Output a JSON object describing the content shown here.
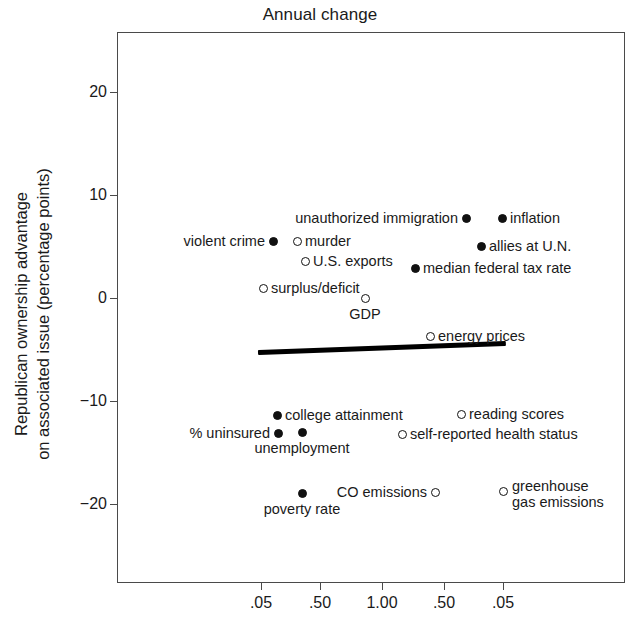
{
  "chart_data": {
    "type": "scatter",
    "title": "Annual change",
    "xlabel": "",
    "ylabel": "Republican ownership advantage\non associated issue (percentage points)",
    "ylabel_line1": "Republican ownership advantage",
    "ylabel_line2": "on associated issue (percentage points)",
    "ylim": [
      -26,
      25
    ],
    "yticks": [
      "20",
      "10",
      "0",
      "−10",
      "−20"
    ],
    "ytick_values": [
      20,
      10,
      0,
      -10,
      -20
    ],
    "xticks": [
      ".05",
      ".50",
      "1.00",
      ".50",
      ".05"
    ],
    "xtick_px": [
      261,
      320,
      382,
      444,
      503
    ],
    "grid": false,
    "legend": "none",
    "marker_styles": {
      "filled": "Republican-owned issue (solid circle)",
      "open": "Democratic-owned issue (open circle)"
    },
    "trendline": {
      "x_start_px": 258,
      "y_start_px": 352,
      "x_end_px": 506,
      "y_end_px": 343,
      "y_start_value": -4.3,
      "y_end_value": -3.5
    },
    "points": [
      {
        "label": "unauthorized immigration",
        "x_px": 466,
        "y_px": 218,
        "y_value": 8.3,
        "marker": "filled",
        "label_side": "left"
      },
      {
        "label": "inflation",
        "x_px": 502,
        "y_px": 218,
        "y_value": 8.3,
        "marker": "filled",
        "label_side": "right"
      },
      {
        "label": "violent crime",
        "x_px": 273,
        "y_px": 241,
        "y_value": 6.2,
        "marker": "filled",
        "label_side": "left"
      },
      {
        "label": "murder",
        "x_px": 297,
        "y_px": 241,
        "y_value": 6.2,
        "marker": "open",
        "label_side": "right"
      },
      {
        "label": "allies at U.N.",
        "x_px": 481,
        "y_px": 246,
        "y_value": 5.7,
        "marker": "filled",
        "label_side": "right"
      },
      {
        "label": "U.S. exports",
        "x_px": 305,
        "y_px": 261,
        "y_value": 4.4,
        "marker": "open",
        "label_side": "right"
      },
      {
        "label": "median federal tax rate",
        "x_px": 415,
        "y_px": 268,
        "y_value": 3.7,
        "marker": "filled",
        "label_side": "right"
      },
      {
        "label": "surplus/deficit",
        "x_px": 263,
        "y_px": 288,
        "y_value": 1.9,
        "marker": "open",
        "label_side": "right"
      },
      {
        "label": "GDP",
        "x_px": 365,
        "y_px": 298,
        "y_value": 0.8,
        "marker": "open",
        "label_side": "below"
      },
      {
        "label": "energy prices",
        "x_px": 430,
        "y_px": 336,
        "y_value": -2.8,
        "marker": "open",
        "label_side": "right"
      },
      {
        "label": "college attainment",
        "x_px": 277,
        "y_px": 415,
        "y_value": -10.2,
        "marker": "filled",
        "label_side": "right"
      },
      {
        "label": "reading scores",
        "x_px": 461,
        "y_px": 414,
        "y_value": -10.1,
        "marker": "open",
        "label_side": "right"
      },
      {
        "label": "% uninsured",
        "x_px": 278,
        "y_px": 433,
        "y_value": -12.0,
        "marker": "filled",
        "label_side": "left"
      },
      {
        "label": "unemployment",
        "x_px": 302,
        "y_px": 432,
        "y_value": -11.9,
        "marker": "filled",
        "label_side": "below"
      },
      {
        "label": "self-reported health status",
        "x_px": 402,
        "y_px": 434,
        "y_value": -12.1,
        "marker": "open",
        "label_side": "right"
      },
      {
        "label": "greenhouse gas emissions",
        "x_px": 503,
        "y_px": 491,
        "y_value": -17.5,
        "marker": "open",
        "label_side": "right-two-line"
      },
      {
        "label": "CO emissions",
        "x_px": 435,
        "y_px": 492,
        "y_value": -17.6,
        "marker": "open",
        "label_side": "left"
      },
      {
        "label": "poverty rate",
        "x_px": 302,
        "y_px": 493,
        "y_value": -18.3,
        "marker": "filled",
        "label_side": "below"
      }
    ]
  }
}
